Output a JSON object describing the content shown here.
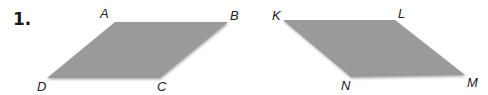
{
  "problem": {
    "number": "1."
  },
  "shapes": [
    {
      "name": "ABCD",
      "fill": "#9a9a9a",
      "vertices": [
        {
          "label": "A",
          "x": 115,
          "y": 22
        },
        {
          "label": "B",
          "x": 228,
          "y": 22
        },
        {
          "label": "C",
          "x": 160,
          "y": 78
        },
        {
          "label": "D",
          "x": 47,
          "y": 78
        }
      ]
    },
    {
      "name": "KLMN",
      "fill": "#9a9a9a",
      "vertices": [
        {
          "label": "K",
          "x": 283,
          "y": 20
        },
        {
          "label": "L",
          "x": 395,
          "y": 20
        },
        {
          "label": "M",
          "x": 465,
          "y": 75
        },
        {
          "label": "N",
          "x": 351,
          "y": 77
        }
      ]
    }
  ],
  "labels": {
    "A": "A",
    "B": "B",
    "C": "C",
    "D": "D",
    "K": "K",
    "L": "L",
    "M": "M",
    "N": "N"
  }
}
